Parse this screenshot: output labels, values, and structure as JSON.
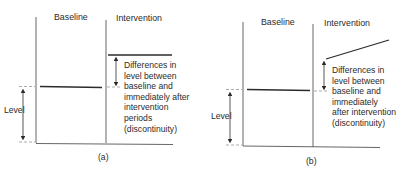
{
  "panels": [
    {
      "id": "a",
      "caption": "(a)",
      "phase_labels": {
        "baseline": "Baseline",
        "intervention": "Intervention"
      },
      "level_label": "Level",
      "annotation_lines": [
        "Differences in",
        "level between",
        "baseline and",
        "immediately after",
        "intervention",
        "periods",
        "(discontinuity)"
      ],
      "intervention_trend": "flat"
    },
    {
      "id": "b",
      "caption": "(b)",
      "phase_labels": {
        "baseline": "Baseline",
        "intervention": "Intervention"
      },
      "level_label": "Level",
      "annotation_lines": [
        "Differences in",
        "level between",
        "baseline and",
        "immediately",
        "after intervention",
        "(discontinuity)"
      ],
      "intervention_trend": "rising"
    }
  ],
  "colors": {
    "line": "#2b2b2b",
    "axis": "#555555",
    "dash": "#888888",
    "text": "#2b2b2b"
  }
}
